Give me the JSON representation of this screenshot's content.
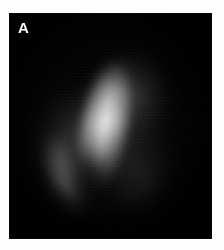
{
  "figure": {
    "panel_label": "A",
    "modality_caption": "",
    "canvas": {
      "width": 224,
      "height": 250,
      "background_color": "#ffffff"
    },
    "panel": {
      "x": 9,
      "y": 13,
      "width": 203,
      "height": 226,
      "background_color": "#020202",
      "label_color": "#ffffff"
    },
    "colors": {
      "background": "#ffffff",
      "panel_background": "#020202",
      "label": "#ffffff",
      "signal_low": "#1a1a1a",
      "signal_mid": "#3a3a3a",
      "signal_high": "#6e6e6e",
      "signal_peak": "#9a9a9a"
    },
    "regions": [
      {
        "name": "broad-halo",
        "intensity": "low",
        "position": "center"
      },
      {
        "name": "upper-right-lobe",
        "intensity": "medium",
        "position": "upper-right"
      },
      {
        "name": "left-lobe",
        "intensity": "medium",
        "position": "left"
      },
      {
        "name": "lower-left-lobe",
        "intensity": "low",
        "position": "lower-left"
      },
      {
        "name": "lower-right-lobe",
        "intensity": "low",
        "position": "lower-right"
      },
      {
        "name": "hot-streak",
        "intensity": "high",
        "position": "center-diagonal"
      },
      {
        "name": "crescent-arm",
        "intensity": "medium",
        "position": "mid-left"
      },
      {
        "name": "cold-notch",
        "intensity": "none",
        "position": "center-lower-left"
      }
    ]
  }
}
